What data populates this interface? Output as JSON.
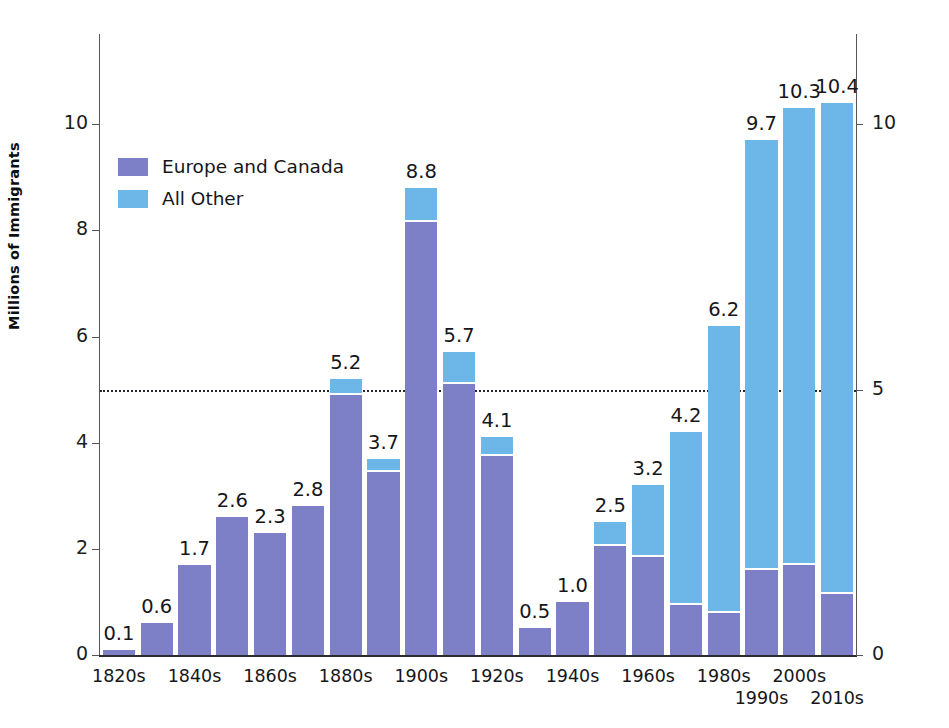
{
  "top_caption": "",
  "chart_data": {
    "type": "bar",
    "subtype": "stacked",
    "title": "",
    "xlabel": "",
    "ylabel": "Millions of Immigrants",
    "ylim": [
      0,
      11.7
    ],
    "grid": false,
    "legend_position": "upper-left",
    "reference_line": {
      "value": 5,
      "style": "dotted"
    },
    "left_axis": {
      "ticks": [
        0,
        2,
        4,
        6,
        8,
        10
      ],
      "labels": [
        "0",
        "2",
        "4",
        "6",
        "8",
        "10"
      ]
    },
    "right_axis": {
      "ticks": [
        0,
        5,
        10
      ],
      "labels": [
        "0",
        "5",
        "10"
      ]
    },
    "categories": [
      "1820s",
      "1830s",
      "1840s",
      "1850s",
      "1860s",
      "1870s",
      "1880s",
      "1890s",
      "1900s",
      "1910s",
      "1920s",
      "1930s",
      "1940s",
      "1950s",
      "1960s",
      "1970s",
      "1980s",
      "1990s",
      "2000s",
      "2010s"
    ],
    "tick_labels": [
      "1820s",
      "",
      "1840s",
      "",
      "1860s",
      "",
      "1880s",
      "",
      "1900s",
      "",
      "1920s",
      "",
      "1940s",
      "",
      "1960s",
      "",
      "1980s",
      "1990s",
      "2000s",
      "2010s"
    ],
    "totals": [
      0.1,
      0.6,
      1.7,
      2.6,
      2.3,
      2.8,
      5.2,
      3.7,
      8.8,
      5.7,
      4.1,
      0.5,
      1.0,
      2.5,
      3.2,
      4.2,
      6.2,
      9.7,
      10.3,
      10.4
    ],
    "value_labels": [
      "0.1",
      "0.6",
      "1.7",
      "2.6",
      "2.3",
      "2.8",
      "5.2",
      "3.7",
      "8.8",
      "5.7",
      "4.1",
      "0.5",
      "1.0",
      "2.5",
      "3.2",
      "4.2",
      "6.2",
      "9.7",
      "10.3",
      "10.4"
    ],
    "series": [
      {
        "name": "Europe and Canada",
        "color": "#7d80c6",
        "values": [
          0.1,
          0.6,
          1.7,
          2.6,
          2.3,
          2.8,
          4.9,
          3.45,
          8.15,
          5.1,
          3.75,
          0.5,
          1.0,
          2.05,
          1.85,
          0.95,
          0.8,
          1.6,
          1.7,
          1.15
        ]
      },
      {
        "name": "All Other",
        "color": "#6cb6e8",
        "values": [
          0.0,
          0.0,
          0.0,
          0.0,
          0.0,
          0.0,
          0.3,
          0.25,
          0.65,
          0.6,
          0.35,
          0.0,
          0.0,
          0.45,
          1.35,
          3.25,
          5.4,
          8.1,
          8.6,
          9.25
        ]
      }
    ]
  },
  "legend": {
    "items": [
      {
        "label": "Europe and Canada",
        "color": "#7d80c6"
      },
      {
        "label": "All Other",
        "color": "#6cb6e8"
      }
    ]
  }
}
